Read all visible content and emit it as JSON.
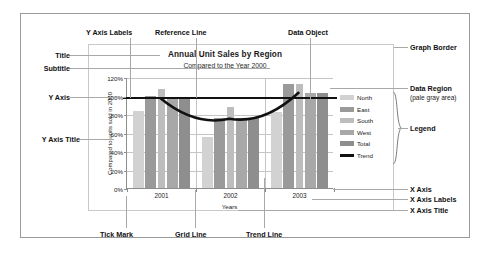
{
  "chart_data": {
    "type": "bar",
    "title": "Annual Unit Sales by Region",
    "subtitle": "Compared to the Year 2000",
    "xlabel": "Years",
    "ylabel": "Compared to units sold in 2000",
    "categories": [
      "2001",
      "2002",
      "2003"
    ],
    "ylim": [
      0,
      120
    ],
    "ytick_labels": [
      "0%",
      "20%",
      "40%",
      "60%",
      "80%",
      "100%",
      "120%"
    ],
    "ytick_values": [
      0,
      20,
      40,
      60,
      80,
      100,
      120
    ],
    "grid": true,
    "legend_position": "right",
    "reference_line": {
      "label": "Reference Line",
      "value": 100
    },
    "series": [
      {
        "name": "North",
        "color": "#d2d2d2",
        "values": [
          83,
          55,
          82
        ]
      },
      {
        "name": "East",
        "color": "#9a9a9a",
        "values": [
          99,
          76,
          112
        ]
      },
      {
        "name": "South",
        "color": "#bdbdbd",
        "values": [
          107,
          88,
          112
        ]
      },
      {
        "name": "West",
        "color": "#a8a8a8",
        "values": [
          96,
          76,
          103
        ]
      },
      {
        "name": "Total",
        "color": "#8e8e8e",
        "values": [
          96,
          76,
          103
        ]
      }
    ],
    "trend": {
      "name": "Trend",
      "color": "#111111",
      "values": [
        98,
        76,
        104
      ]
    }
  },
  "annotations": {
    "y_axis_labels": "Y Axis Labels",
    "reference_line": "Reference Line",
    "data_object": "Data Object",
    "title": "Title",
    "subtitle": "Subtitle",
    "y_axis": "Y Axis",
    "y_axis_title": "Y Axis Title",
    "graph_border": "Graph Border",
    "data_region": "Data Region",
    "data_region_note": "(pale gray area)",
    "legend": "Legend",
    "x_axis": "X Axis",
    "x_axis_labels": "X Axis Labels",
    "x_axis_title": "X Axis Title",
    "tick_mark": "Tick Mark",
    "grid_line": "Grid Line",
    "trend_line": "Trend Line"
  },
  "colors": {
    "frame": "#9a9a9a",
    "graph_border": "#c9c9c9",
    "gridline": "#c4c4c4",
    "axis": "#8d8d8d",
    "leader": "#a8a8a8",
    "text": "#111111"
  }
}
